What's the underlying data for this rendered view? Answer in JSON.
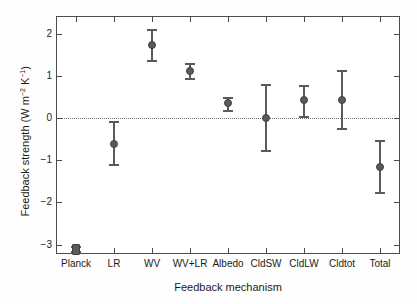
{
  "chart_data": {
    "type": "scatter",
    "title": "",
    "xlabel": "Feedback mechanism",
    "ylabel": "Feedback strength (W m-2 K-1)",
    "ylabel_parts": {
      "prefix": "Feedback strength (W m",
      "exp1": "−2",
      "mid": " K",
      "exp2": "−1",
      "suffix": ")"
    },
    "categories": [
      "Planck",
      "LR",
      "WV",
      "WV+LR",
      "Albedo",
      "CldSW",
      "CldLW",
      "Cldtot",
      "Total"
    ],
    "values": [
      -3.12,
      -0.62,
      1.73,
      1.12,
      0.36,
      0.01,
      0.42,
      0.43,
      -1.15
    ],
    "err_low": [
      -3.18,
      -1.12,
      1.36,
      0.93,
      0.18,
      -0.77,
      0.03,
      -0.26,
      -1.78
    ],
    "err_high": [
      -3.06,
      -0.1,
      2.09,
      1.28,
      0.48,
      0.79,
      0.77,
      1.12,
      -0.54
    ],
    "ylim": [
      -3.2,
      2.4
    ],
    "yticks": [
      2,
      1,
      0,
      -1,
      -2,
      -3
    ],
    "yticklabels": [
      "2",
      "1",
      "0",
      "−1",
      "−2",
      "−3"
    ],
    "grid": false,
    "legend": "none",
    "zero_reference_line": 0,
    "marker_color": "#5a5a5a",
    "axis_color": "#4d4d4d",
    "marker_shapes": [
      "square",
      "circle",
      "circle",
      "circle",
      "circle",
      "circle",
      "circle",
      "circle",
      "circle"
    ]
  }
}
